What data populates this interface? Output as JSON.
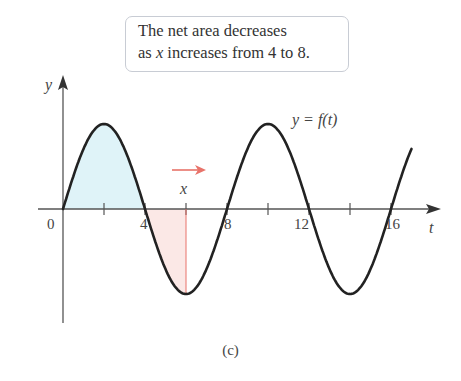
{
  "callout": {
    "line1": "The net area decreases",
    "line2_pre": "as ",
    "line2_var": "x",
    "line2_post": " increases from 4 to 8."
  },
  "axes": {
    "y_label": "y",
    "t_label": "t",
    "origin_label": "0",
    "tick_labels": [
      "4",
      "8",
      "12",
      "16"
    ]
  },
  "curve_label": "y = f(t)",
  "marker_label": "x",
  "caption": "(c)",
  "colors": {
    "curve": "#222222",
    "positive_fill": "#dff3f8",
    "negative_fill": "#fbe8e6",
    "marker": "#e8736a",
    "axis": "#555555"
  },
  "chart_data": {
    "type": "line",
    "title": "",
    "xlabel": "t",
    "ylabel": "y",
    "function": "f(t) = sin(pi * t / 4)",
    "x": [
      0,
      2,
      4,
      6,
      8,
      10,
      12,
      14,
      16,
      17
    ],
    "values": [
      0,
      1,
      0,
      -1,
      0,
      1,
      0,
      -1,
      0,
      0.71
    ],
    "xlim": [
      -1,
      18
    ],
    "ylim": [
      -1.4,
      1.55
    ],
    "x_ticks": [
      2,
      4,
      6,
      8,
      10,
      12,
      14,
      16
    ],
    "x_tick_labels": [
      "",
      "4",
      "",
      "8",
      "",
      "12",
      "",
      "16"
    ],
    "marker_x": 6,
    "shaded_regions": [
      {
        "from": 0,
        "to": 4,
        "sign": "positive",
        "color": "#dff3f8"
      },
      {
        "from": 4,
        "to": 6,
        "sign": "negative",
        "color": "#fbe8e6"
      }
    ],
    "annotation": "The net area decreases as x increases from 4 to 8.",
    "grid": false,
    "legend": false
  }
}
